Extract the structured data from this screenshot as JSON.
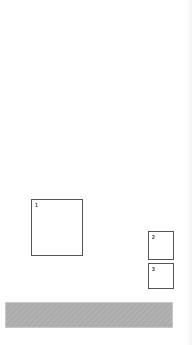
{
  "boxes": [
    {
      "label": "1"
    },
    {
      "label": "2"
    },
    {
      "label": "3"
    }
  ],
  "bar": {
    "color": "#aeaeae"
  }
}
